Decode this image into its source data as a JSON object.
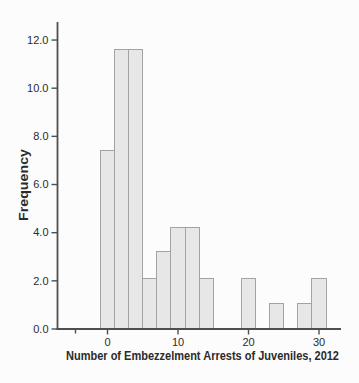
{
  "chart_data": {
    "type": "bar",
    "subtype": "histogram",
    "title": "",
    "xlabel": "Number of Embezzelment Arrests of Juveniles, 2012",
    "ylabel": "Frequency",
    "bin_width": 2,
    "bin_centers": [
      0,
      2,
      4,
      6,
      8,
      10,
      12,
      14,
      20,
      24,
      28,
      30
    ],
    "values": [
      7.4,
      11.6,
      11.6,
      2.1,
      3.2,
      4.2,
      4.2,
      2.1,
      2.1,
      1.05,
      1.05,
      2.1
    ],
    "x_ticks": [
      {
        "v": 0,
        "label": "0"
      },
      {
        "v": 10,
        "label": "10"
      },
      {
        "v": 20,
        "label": "20"
      },
      {
        "v": 30,
        "label": "30"
      }
    ],
    "y_ticks": [
      {
        "v": 0,
        "label": "0.0"
      },
      {
        "v": 2,
        "label": "2.0"
      },
      {
        "v": 4,
        "label": "4.0"
      },
      {
        "v": 6,
        "label": "6.0"
      },
      {
        "v": 8,
        "label": "8.0"
      },
      {
        "v": 10,
        "label": "10.0"
      },
      {
        "v": 12,
        "label": "12.0"
      }
    ],
    "xlim": [
      -7.1,
      33.1
    ],
    "ylim": [
      0,
      12.75
    ],
    "grid": false,
    "legend": "none",
    "colors": {
      "bar_fill": "#e7e7e7",
      "bar_stroke": "#a3a3a3",
      "axis": "#4f4f4f",
      "text": "#2b2b2b",
      "background": "#fcfcfc"
    }
  }
}
